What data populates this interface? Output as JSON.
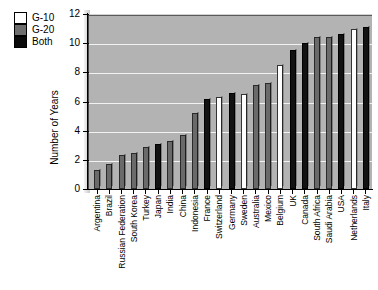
{
  "chart_data": {
    "type": "bar",
    "title": "",
    "xlabel": "",
    "ylabel": "Number of Years",
    "ylim": [
      0,
      12
    ],
    "yticks": [
      0,
      2,
      4,
      6,
      8,
      10,
      12
    ],
    "grid": true,
    "legend_position": "top-left-outside",
    "legend": [
      {
        "label": "G-10",
        "color": "#ffffff"
      },
      {
        "label": "G-20",
        "color": "#6a6a6a"
      },
      {
        "label": "Both",
        "color": "#121212"
      }
    ],
    "categories": [
      "Argentina",
      "Brazil",
      "Russian Federation",
      "South Korea",
      "Turkey",
      "Japan",
      "India",
      "China",
      "Indonesia",
      "France",
      "Switzerland",
      "Germany",
      "Sweden",
      "Australia",
      "Mexico",
      "Belgium",
      "UK",
      "Canada",
      "South Africa",
      "Saudi Arabia",
      "USA",
      "Netherlands",
      "Italy"
    ],
    "values": [
      1.3,
      1.7,
      2.3,
      2.5,
      2.9,
      3.1,
      3.3,
      3.7,
      5.2,
      6.2,
      6.3,
      6.6,
      6.5,
      7.1,
      7.3,
      8.5,
      9.5,
      10.0,
      10.4,
      10.4,
      10.6,
      11.0,
      11.1
    ],
    "groups": [
      "G-20",
      "G-20",
      "G-20",
      "G-20",
      "G-20",
      "Both",
      "G-20",
      "G-20",
      "G-20",
      "Both",
      "G-10",
      "Both",
      "G-10",
      "G-20",
      "G-20",
      "G-10",
      "Both",
      "Both",
      "G-20",
      "G-20",
      "Both",
      "G-10",
      "Both"
    ]
  },
  "colors": {
    "g10": "#ffffff",
    "g20": "#6a6a6a",
    "both": "#121212",
    "plot_background": "#b3b3b3",
    "gridline": "#f2f2f2",
    "axis": "#000000"
  }
}
